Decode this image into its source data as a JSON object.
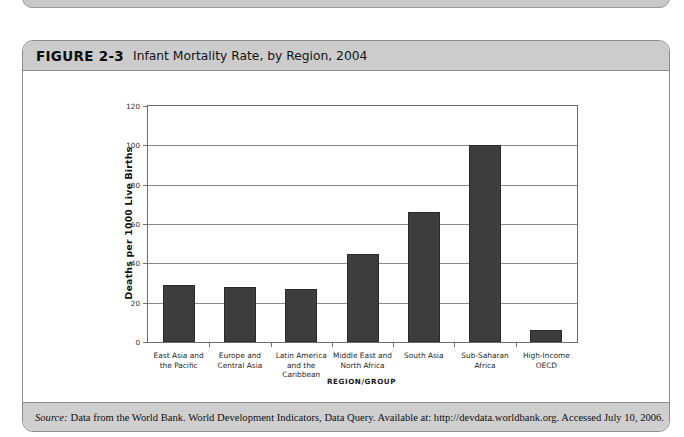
{
  "figure": {
    "label": "FIGURE 2-3",
    "title": "Infant Mortality Rate, by Region, 2004",
    "source_word": "Source:",
    "source_text": "Data from the World Bank. World Development Indicators, Data Query. Available at: http://devdata.worldbank.org. Accessed July 10, 2006."
  },
  "chart_data": {
    "type": "bar",
    "title": "Infant Mortality Rate, by Region, 2004",
    "xlabel": "REGION/GROUP",
    "ylabel": "Deaths per 1000 Live Births",
    "ylim": [
      0,
      120
    ],
    "yticks": [
      0,
      20,
      40,
      60,
      80,
      100,
      120
    ],
    "ytick_labels": [
      "0",
      "20",
      "40",
      "60",
      "80",
      "100",
      "120"
    ],
    "grid": true,
    "legend": null,
    "bar_color": "#3d3d3d",
    "categories": [
      "East Asia and the Pacific",
      "Europe and Central Asia",
      "Latin America and the Caribbean",
      "Middle East and North Africa",
      "South Asia",
      "Sub-Saharan Africa",
      "High-Income OECD"
    ],
    "category_lines": [
      [
        "East Asia and",
        "the Pacific"
      ],
      [
        "Europe and",
        "Central Asia"
      ],
      [
        "Latin America",
        "and the",
        "Caribbean"
      ],
      [
        "Middle East and",
        "North Africa"
      ],
      [
        "South Asia"
      ],
      [
        "Sub-Saharan",
        "Africa"
      ],
      [
        "High-Income",
        "OECD"
      ]
    ],
    "values": [
      29,
      28,
      27,
      45,
      66,
      100,
      6
    ]
  }
}
